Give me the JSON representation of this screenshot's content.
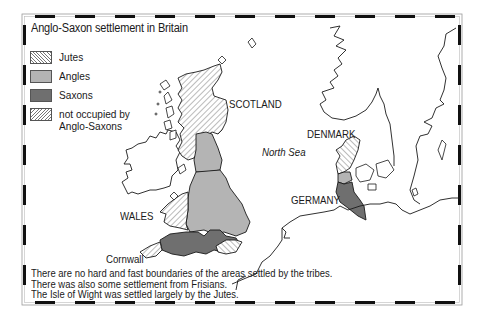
{
  "map": {
    "title": "Anglo-Saxon settlement in Britain",
    "legend": [
      {
        "key": "jutes",
        "label": "Jutes",
        "pattern": "hatched-backslash"
      },
      {
        "key": "angles",
        "label": "Angles",
        "color": "#b4b4b4"
      },
      {
        "key": "saxons",
        "label": "Saxons",
        "color": "#6f6f6f"
      },
      {
        "key": "not_occupied",
        "label_line1": "not occupied by",
        "label_line2": "Anglo-Saxons",
        "pattern": "hatched-slash"
      }
    ],
    "place_labels": {
      "scotland": "SCOTLAND",
      "wales": "WALES",
      "cornwall": "Cornwall",
      "denmark": "DENMARK",
      "germany": "GERMANY",
      "north_sea": "North Sea"
    },
    "notes": [
      "There are no hard and fast boundaries of the areas settled by the tribes.",
      "There was also some settlement from Frisians.",
      "The Isle of Wight was settled largely by the Jutes."
    ],
    "colors": {
      "angles": "#b4b4b4",
      "saxons": "#6f6f6f",
      "coastline": "#1a1a1a",
      "frame_dash": "#111111"
    }
  }
}
